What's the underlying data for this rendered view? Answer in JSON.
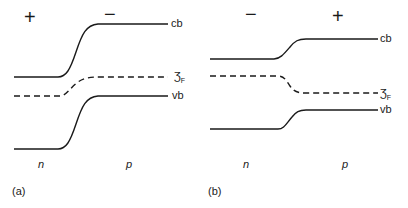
{
  "panels": [
    {
      "id": "a",
      "caption": "(a)",
      "signs": {
        "left": "+",
        "right": "−"
      },
      "regions": {
        "left": "n",
        "right": "p"
      },
      "bands": {
        "cb": "cb",
        "vb": "vb"
      },
      "fermi": {
        "symbol": "Ʒ",
        "subscript": "F"
      },
      "fermi_label": "ƷF",
      "paths": {
        "cb": "M14,77 L58,77 C66,77 70,70 76,52 C82,34 86,25 98,24 L168,24",
        "fermi": "M14,96 L60,96 C66,96 70,88 78,82 C84,78 90,77 100,77 L168,77",
        "vb": "M14,149 L58,149 C66,149 70,142 76,124 C82,106 86,97 98,96 L168,96"
      }
    },
    {
      "id": "b",
      "caption": "(b)",
      "signs": {
        "left": "−",
        "right": "+"
      },
      "regions": {
        "left": "n",
        "right": "p"
      },
      "bands": {
        "cb": "cb",
        "vb": "vb"
      },
      "fermi": {
        "symbol": "Ʒ",
        "subscript": "F"
      },
      "fermi_label": "ƷF",
      "paths": {
        "cb": "M210,59 L274,59 C280,59 284,54 290,47 C295,41 298,39 306,39 L378,39",
        "fermi": "M210,76 L278,76 C284,76 286,80 290,86 C294,92 298,93 306,93 L378,93",
        "vb": "M210,129 L278,129 C284,129 286,124 292,117 C296,112 299,110 306,110 L378,110"
      }
    }
  ],
  "colors": {
    "line": "#1a1a1a",
    "background": "#ffffff"
  }
}
